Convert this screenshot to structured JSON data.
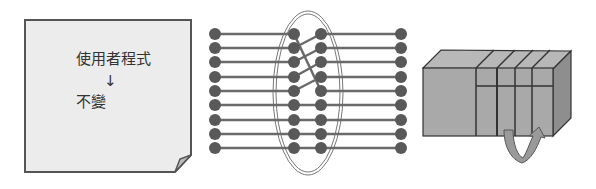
{
  "panels": {
    "program_note": {
      "line1": "使用者程式",
      "arrow": "↓",
      "line2": "不變"
    },
    "wiring": {
      "rows": 9,
      "description": "rewired connections inside oval"
    },
    "hardware": {
      "description": "modular box with swap arrow"
    }
  },
  "colors": {
    "paper_fill": "#ececec",
    "paper_border": "#555555",
    "dot": "#595959",
    "wire": "#6a6a6a",
    "box_front": "#a9a9a9",
    "box_top": "#b8b8b8",
    "box_side": "#8e8e8e",
    "arrow_fill": "#9a9a9a"
  }
}
